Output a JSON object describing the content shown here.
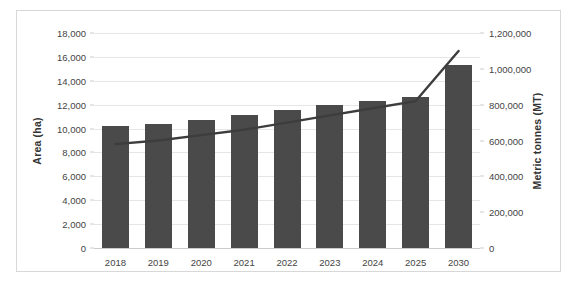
{
  "chart_data": {
    "type": "bar",
    "title": "",
    "subtitle": "",
    "categories": [
      "2018",
      "2019",
      "2020",
      "2021",
      "2022",
      "2023",
      "2024",
      "2025",
      "2030"
    ],
    "series": [
      {
        "name": "Area (ha)",
        "type": "bar",
        "axis": "left",
        "unit": "ha",
        "color": "#4a4a4a",
        "values": [
          10200,
          10400,
          10750,
          11150,
          11550,
          12000,
          12350,
          12650,
          15300
        ]
      },
      {
        "name": "Metric tonnes (MT)",
        "type": "line",
        "axis": "right",
        "unit": "MT",
        "color": "#3d3d3d",
        "values": [
          580000,
          600000,
          630000,
          660000,
          700000,
          740000,
          780000,
          820000,
          1100000
        ]
      }
    ],
    "xlabel": "",
    "ylabel_left": "Area (ha)",
    "ylabel_right": "Metric tonnes (MT)",
    "ylim_left": [
      0,
      18000
    ],
    "ylim_right": [
      0,
      1200000
    ],
    "yticks_left": [
      0,
      2000,
      4000,
      6000,
      8000,
      10000,
      12000,
      14000,
      16000,
      18000
    ],
    "yticks_right": [
      0,
      200000,
      400000,
      600000,
      800000,
      1000000,
      1200000
    ],
    "ytick_labels_left": [
      "0",
      "2,000",
      "4,000",
      "6,000",
      "8,000",
      "10,000",
      "12,000",
      "14,000",
      "16,000",
      "18,000"
    ],
    "ytick_labels_right": [
      "0",
      "200,000",
      "400,000",
      "600,000",
      "800,000",
      "1,000,000",
      "1,200,000"
    ],
    "grid": true,
    "legend": "none",
    "background": "#ffffff",
    "grid_color": "#e6e6e6",
    "border_color": "#d8d8d8"
  }
}
